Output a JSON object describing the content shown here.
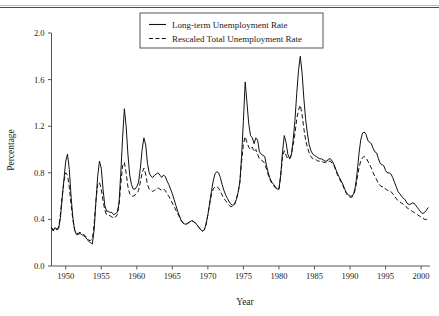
{
  "figure": {
    "has_top_rule": true,
    "background": "#ffffff",
    "ink_color": "#111111",
    "axis_color": "#555555"
  },
  "chart_data": {
    "type": "line",
    "title": "",
    "xlabel": "Year",
    "ylabel": "Percentage",
    "xlim": [
      1948,
      2001.25
    ],
    "ylim": [
      0.0,
      2.0
    ],
    "xticks": [
      1950,
      1955,
      1960,
      1965,
      1970,
      1975,
      1980,
      1985,
      1990,
      1995,
      2000
    ],
    "xtick_labels": [
      "1950",
      "1955",
      "1960",
      "1965",
      "1970",
      "1975",
      "1980",
      "1985",
      "1990",
      "1995",
      "2000"
    ],
    "yticks": [
      0.0,
      0.4,
      0.8,
      1.2,
      1.6,
      2.0
    ],
    "ytick_labels": [
      "0.0",
      "0.4",
      "0.8",
      "1.2",
      "1.6",
      "2.0"
    ],
    "grid": false,
    "legend_position": "top-center",
    "legend_entries": [
      {
        "label": "Long-term Unemployment Rate",
        "style": "solid"
      },
      {
        "label": "Rescaled Total Unemployment Rate",
        "style": "dashed"
      }
    ],
    "x": [
      1948.0,
      1948.25,
      1948.5,
      1948.75,
      1949.0,
      1949.25,
      1949.5,
      1949.75,
      1950.0,
      1950.25,
      1950.5,
      1950.75,
      1951.0,
      1951.25,
      1951.5,
      1951.75,
      1952.0,
      1952.25,
      1952.5,
      1952.75,
      1953.0,
      1953.25,
      1953.5,
      1953.75,
      1954.0,
      1954.25,
      1954.5,
      1954.75,
      1955.0,
      1955.25,
      1955.5,
      1955.75,
      1956.0,
      1956.25,
      1956.5,
      1956.75,
      1957.0,
      1957.25,
      1957.5,
      1957.75,
      1958.0,
      1958.25,
      1958.5,
      1958.75,
      1959.0,
      1959.25,
      1959.5,
      1959.75,
      1960.0,
      1960.25,
      1960.5,
      1960.75,
      1961.0,
      1961.25,
      1961.5,
      1961.75,
      1962.0,
      1962.25,
      1962.5,
      1962.75,
      1963.0,
      1963.25,
      1963.5,
      1963.75,
      1964.0,
      1964.25,
      1964.5,
      1964.75,
      1965.0,
      1965.25,
      1965.5,
      1965.75,
      1966.0,
      1966.25,
      1966.5,
      1966.75,
      1967.0,
      1967.25,
      1967.5,
      1967.75,
      1968.0,
      1968.25,
      1968.5,
      1968.75,
      1969.0,
      1969.25,
      1969.5,
      1969.75,
      1970.0,
      1970.25,
      1970.5,
      1970.75,
      1971.0,
      1971.25,
      1971.5,
      1971.75,
      1972.0,
      1972.25,
      1972.5,
      1972.75,
      1973.0,
      1973.25,
      1973.5,
      1973.75,
      1974.0,
      1974.25,
      1974.5,
      1974.75,
      1975.0,
      1975.25,
      1975.5,
      1975.75,
      1976.0,
      1976.25,
      1976.5,
      1976.75,
      1977.0,
      1977.25,
      1977.5,
      1977.75,
      1978.0,
      1978.25,
      1978.5,
      1978.75,
      1979.0,
      1979.25,
      1979.5,
      1979.75,
      1980.0,
      1980.25,
      1980.5,
      1980.75,
      1981.0,
      1981.25,
      1981.5,
      1981.75,
      1982.0,
      1982.25,
      1982.5,
      1982.75,
      1983.0,
      1983.25,
      1983.5,
      1983.75,
      1984.0,
      1984.25,
      1984.5,
      1984.75,
      1985.0,
      1985.25,
      1985.5,
      1985.75,
      1986.0,
      1986.25,
      1986.5,
      1986.75,
      1987.0,
      1987.25,
      1987.5,
      1987.75,
      1988.0,
      1988.25,
      1988.5,
      1988.75,
      1989.0,
      1989.25,
      1989.5,
      1989.75,
      1990.0,
      1990.25,
      1990.5,
      1990.75,
      1991.0,
      1991.25,
      1991.5,
      1991.75,
      1992.0,
      1992.25,
      1992.5,
      1992.75,
      1993.0,
      1993.25,
      1993.5,
      1993.75,
      1994.0,
      1994.25,
      1994.5,
      1994.75,
      1995.0,
      1995.25,
      1995.5,
      1995.75,
      1996.0,
      1996.25,
      1996.5,
      1996.75,
      1997.0,
      1997.25,
      1997.5,
      1997.75,
      1998.0,
      1998.25,
      1998.5,
      1998.75,
      1999.0,
      1999.25,
      1999.5,
      1999.75,
      2000.0,
      2000.25,
      2000.5,
      2000.75,
      2001.0
    ],
    "series": [
      {
        "name": "Long-term Unemployment Rate",
        "style": "solid",
        "values": [
          0.33,
          0.3,
          0.33,
          0.31,
          0.32,
          0.41,
          0.58,
          0.74,
          0.9,
          0.96,
          0.83,
          0.6,
          0.42,
          0.31,
          0.27,
          0.27,
          0.28,
          0.27,
          0.26,
          0.25,
          0.23,
          0.21,
          0.2,
          0.19,
          0.31,
          0.55,
          0.77,
          0.9,
          0.84,
          0.66,
          0.52,
          0.47,
          0.47,
          0.46,
          0.46,
          0.44,
          0.45,
          0.46,
          0.54,
          0.8,
          1.1,
          1.35,
          1.2,
          0.96,
          0.78,
          0.7,
          0.66,
          0.66,
          0.68,
          0.72,
          0.84,
          1.0,
          1.1,
          1.04,
          0.88,
          0.8,
          0.77,
          0.76,
          0.78,
          0.79,
          0.8,
          0.78,
          0.76,
          0.78,
          0.77,
          0.73,
          0.7,
          0.66,
          0.62,
          0.57,
          0.52,
          0.47,
          0.43,
          0.39,
          0.37,
          0.36,
          0.36,
          0.37,
          0.38,
          0.39,
          0.38,
          0.37,
          0.35,
          0.33,
          0.31,
          0.3,
          0.31,
          0.36,
          0.44,
          0.54,
          0.64,
          0.73,
          0.79,
          0.81,
          0.8,
          0.76,
          0.7,
          0.65,
          0.61,
          0.58,
          0.55,
          0.53,
          0.52,
          0.53,
          0.57,
          0.63,
          0.72,
          0.95,
          1.25,
          1.58,
          1.4,
          1.22,
          1.12,
          1.1,
          1.05,
          1.1,
          1.08,
          0.98,
          0.96,
          0.95,
          0.94,
          0.86,
          0.8,
          0.75,
          0.72,
          0.7,
          0.68,
          0.66,
          0.66,
          0.78,
          0.98,
          1.12,
          1.06,
          0.96,
          0.92,
          0.95,
          1.08,
          1.25,
          1.48,
          1.68,
          1.8,
          1.66,
          1.44,
          1.26,
          1.14,
          1.04,
          0.99,
          0.96,
          0.95,
          0.94,
          0.93,
          0.92,
          0.92,
          0.91,
          0.9,
          0.9,
          0.92,
          0.92,
          0.9,
          0.87,
          0.83,
          0.79,
          0.76,
          0.73,
          0.7,
          0.66,
          0.63,
          0.61,
          0.6,
          0.6,
          0.62,
          0.68,
          0.8,
          0.96,
          1.08,
          1.14,
          1.15,
          1.13,
          1.08,
          1.06,
          1.05,
          1.01,
          0.98,
          0.97,
          0.92,
          0.88,
          0.87,
          0.86,
          0.82,
          0.8,
          0.8,
          0.79,
          0.76,
          0.72,
          0.68,
          0.64,
          0.62,
          0.6,
          0.58,
          0.57,
          0.54,
          0.53,
          0.53,
          0.54,
          0.54,
          0.52,
          0.5,
          0.48,
          0.46,
          0.45,
          0.46,
          0.48,
          0.5
        ]
      },
      {
        "name": "Rescaled Total Unemployment Rate",
        "style": "dashed",
        "values": [
          0.33,
          0.31,
          0.33,
          0.32,
          0.33,
          0.44,
          0.6,
          0.73,
          0.8,
          0.78,
          0.68,
          0.53,
          0.4,
          0.31,
          0.28,
          0.28,
          0.29,
          0.28,
          0.27,
          0.26,
          0.24,
          0.22,
          0.22,
          0.23,
          0.36,
          0.56,
          0.7,
          0.72,
          0.66,
          0.56,
          0.48,
          0.44,
          0.44,
          0.43,
          0.42,
          0.41,
          0.42,
          0.44,
          0.52,
          0.7,
          0.86,
          0.89,
          0.8,
          0.68,
          0.62,
          0.6,
          0.6,
          0.61,
          0.62,
          0.65,
          0.72,
          0.8,
          0.84,
          0.79,
          0.7,
          0.66,
          0.65,
          0.64,
          0.65,
          0.66,
          0.67,
          0.66,
          0.65,
          0.66,
          0.65,
          0.62,
          0.6,
          0.57,
          0.54,
          0.51,
          0.48,
          0.45,
          0.42,
          0.39,
          0.37,
          0.36,
          0.36,
          0.37,
          0.38,
          0.39,
          0.38,
          0.37,
          0.35,
          0.33,
          0.31,
          0.3,
          0.31,
          0.36,
          0.44,
          0.53,
          0.61,
          0.66,
          0.68,
          0.68,
          0.67,
          0.64,
          0.61,
          0.58,
          0.56,
          0.54,
          0.52,
          0.51,
          0.51,
          0.53,
          0.57,
          0.63,
          0.72,
          0.9,
          1.05,
          1.11,
          1.06,
          1.02,
          1.0,
          1.02,
          0.98,
          1.0,
          0.96,
          0.92,
          0.91,
          0.9,
          0.88,
          0.83,
          0.78,
          0.74,
          0.71,
          0.69,
          0.67,
          0.66,
          0.66,
          0.78,
          0.93,
          0.99,
          0.95,
          0.92,
          0.92,
          0.96,
          1.04,
          1.14,
          1.26,
          1.34,
          1.38,
          1.3,
          1.18,
          1.08,
          1.02,
          0.97,
          0.94,
          0.92,
          0.92,
          0.91,
          0.9,
          0.9,
          0.9,
          0.89,
          0.89,
          0.89,
          0.9,
          0.9,
          0.88,
          0.86,
          0.82,
          0.78,
          0.75,
          0.72,
          0.69,
          0.65,
          0.62,
          0.6,
          0.59,
          0.59,
          0.61,
          0.66,
          0.75,
          0.84,
          0.9,
          0.93,
          0.94,
          0.93,
          0.9,
          0.87,
          0.84,
          0.8,
          0.77,
          0.74,
          0.71,
          0.69,
          0.68,
          0.68,
          0.66,
          0.65,
          0.65,
          0.64,
          0.62,
          0.6,
          0.58,
          0.56,
          0.55,
          0.54,
          0.53,
          0.52,
          0.5,
          0.49,
          0.48,
          0.47,
          0.46,
          0.45,
          0.44,
          0.43,
          0.42,
          0.41,
          0.4,
          0.4,
          0.4
        ]
      }
    ]
  }
}
